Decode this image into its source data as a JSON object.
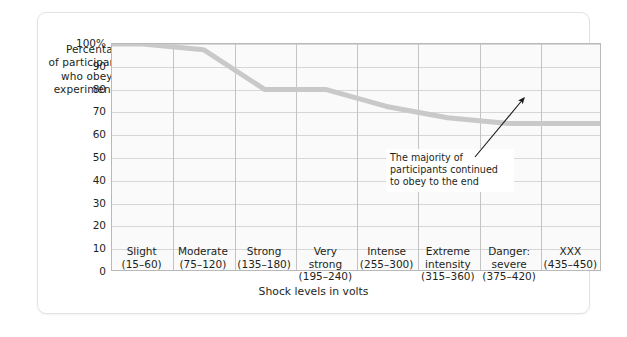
{
  "chart_data": {
    "type": "line",
    "title": "",
    "xlabel": "Shock levels in volts",
    "ylabel": "Percentage of participants who obeyed experimenter",
    "ylabel_lines": [
      "Percentage",
      "of participants",
      "who obeyed",
      "experimenter"
    ],
    "categories": [
      {
        "name": "Slight",
        "range": "(15–60)"
      },
      {
        "name": "Moderate",
        "range": "(75–120)"
      },
      {
        "name": "Strong",
        "range": "(135–180)"
      },
      {
        "name": "Very strong",
        "name_lines": [
          "Very",
          "strong"
        ],
        "range": "(195–240)"
      },
      {
        "name": "Intense",
        "range": "(255–300)"
      },
      {
        "name": "Extreme intensity",
        "name_lines": [
          "Extreme",
          "intensity"
        ],
        "range": "(315–360)"
      },
      {
        "name": "Danger: severe",
        "name_lines": [
          "Danger:",
          "severe"
        ],
        "range": "(375–420)"
      },
      {
        "name": "XXX",
        "range": "(435–450)"
      }
    ],
    "values": [
      100,
      97.5,
      80,
      80,
      72.5,
      67.5,
      65,
      65
    ],
    "ylim": [
      0,
      100
    ],
    "yticks": [
      0,
      10,
      20,
      30,
      40,
      50,
      60,
      70,
      80,
      90,
      100
    ],
    "ytick_labels": [
      "0",
      "10",
      "20",
      "30",
      "40",
      "50",
      "60",
      "70",
      "80",
      "90",
      "100%"
    ],
    "grid": true,
    "legend": false,
    "series_color": "#c9c9c9",
    "annotations": [
      {
        "text": "The majority of participants continued to obey to the end",
        "lines": [
          "The majority of",
          "participants continued",
          "to obey to the end"
        ],
        "arrow": true
      }
    ]
  }
}
